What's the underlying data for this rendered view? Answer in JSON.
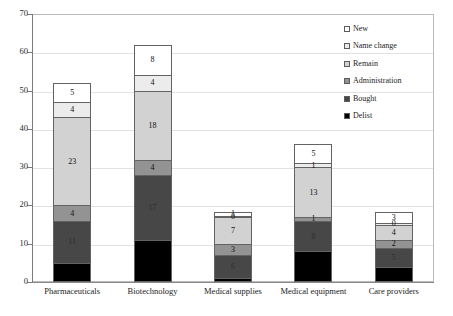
{
  "chart_data": {
    "type": "bar",
    "stacked": true,
    "title": "",
    "subtitle": "",
    "xlabel": "",
    "ylabel": "",
    "ylim": [
      0,
      70
    ],
    "ytick_step": 10,
    "ytick_labels": [
      "0",
      "10",
      "20",
      "30",
      "40",
      "50",
      "60",
      "70"
    ],
    "grid": true,
    "legend_position": "top-right",
    "categories": [
      "Pharmaceuticals",
      "Biotechnology",
      "Medical supplies",
      "Medical equipment",
      "Care providers"
    ],
    "series": [
      {
        "name": "Delist",
        "color": "#000000",
        "values": [
          5,
          11,
          1,
          8,
          4
        ],
        "labels": [
          "",
          "",
          "",
          "",
          ""
        ]
      },
      {
        "name": "Bought",
        "color": "#474747",
        "values": [
          11,
          17,
          6,
          8,
          5
        ],
        "labels": [
          "11",
          "17",
          "6",
          "8",
          "5"
        ]
      },
      {
        "name": "Administration",
        "color": "#939393",
        "values": [
          4,
          4,
          3,
          1,
          2
        ],
        "labels": [
          "4",
          "4",
          "3",
          "1",
          "2"
        ]
      },
      {
        "name": "Remain",
        "color": "#d2d2d2",
        "values": [
          23,
          18,
          7,
          13,
          4
        ],
        "labels": [
          "23",
          "18",
          "7",
          "13",
          "4"
        ]
      },
      {
        "name": "Name change",
        "color": "#ececec",
        "values": [
          4,
          4,
          0.3,
          1,
          0.4
        ],
        "labels": [
          "4",
          "4",
          "0",
          "1",
          "0"
        ]
      },
      {
        "name": "New",
        "color": "#ffffff",
        "values": [
          5,
          8,
          1,
          5,
          3
        ],
        "labels": [
          "5",
          "8",
          "1",
          "5",
          "3"
        ]
      }
    ],
    "totals": [
      52,
      62,
      18.3,
      36.4,
      18.4
    ]
  },
  "legend": {
    "items": [
      {
        "label": "New",
        "color": "#ffffff"
      },
      {
        "label": "Name change",
        "color": "#ececec"
      },
      {
        "label": "Remain",
        "color": "#d2d2d2"
      },
      {
        "label": "Administration",
        "color": "#939393"
      },
      {
        "label": "Bought",
        "color": "#474747"
      },
      {
        "label": "Delist",
        "color": "#000000"
      }
    ]
  },
  "axes": {
    "y_max": 70,
    "y_min": 0,
    "y_ticks": [
      70,
      60,
      50,
      40,
      30,
      20,
      10,
      0
    ]
  }
}
